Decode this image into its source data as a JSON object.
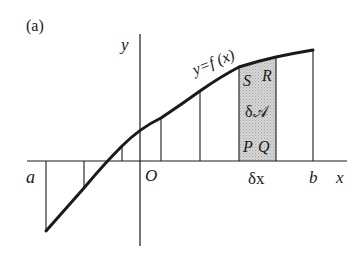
{
  "figure": {
    "panel_label": "(a)",
    "axes": {
      "x_label": "x",
      "y_label": "y",
      "origin_label": "O"
    },
    "curve_label": "y=f (x)",
    "limits": {
      "lower": "a",
      "upper": "b"
    },
    "strip": {
      "area_label": "δ𝒜",
      "width_label": "δx",
      "corners": {
        "top_left": "S",
        "top_right": "R",
        "bottom_left": "P",
        "bottom_right": "Q"
      },
      "fill_color": "#c8c8c8"
    },
    "colors": {
      "ink": "#1a1a1a",
      "background": "#ffffff"
    }
  }
}
